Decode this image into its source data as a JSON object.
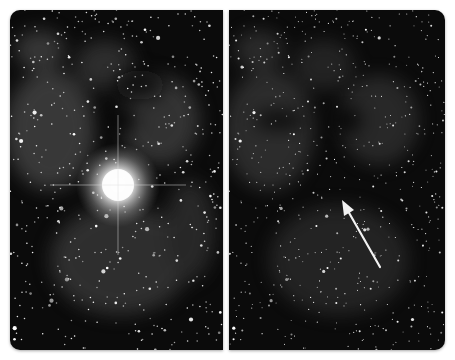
{
  "figure": {
    "panels": [
      {
        "id": "before",
        "description": "Star field with nebula; bright glowing star with diffraction spikes near center",
        "bright_star": {
          "cx": 108,
          "cy": 175
        }
      },
      {
        "id": "after",
        "description": "Same star field; bright star absent; arrow marks its former position",
        "arrow": {
          "tail": [
            151,
            257
          ],
          "tip": [
            113,
            190
          ],
          "color": "#f2f2f2"
        }
      }
    ],
    "colors": {
      "background": "#ffffff",
      "sky": "#0b0b0b",
      "nebula": "#5a5a5a",
      "star": "#ffffff"
    }
  }
}
